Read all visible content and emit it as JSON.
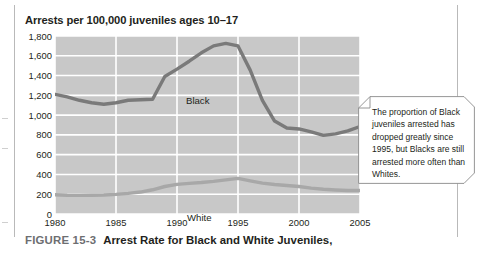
{
  "figure": {
    "chart_title": "Arrests per 100,000 juveniles ages 10–17",
    "caption_number": "FIGURE 15-3",
    "caption_text": "Arrest Rate for Black and White Juveniles,"
  },
  "callout": {
    "text": "The proportion of Black juveniles arrested has dropped greatly since 1995, but Blacks are still arrested more often than Whites."
  },
  "colors": {
    "plot_background": "#c8c8c8",
    "gridline": "#ffffff",
    "series_black": "#7a7a7a",
    "series_white": "#a8a8a8",
    "text": "#231f20",
    "caption_number": "#6d6e71",
    "page_border": "#b9b9b9"
  },
  "chart_data": {
    "type": "line",
    "title": "Arrests per 100,000 juveniles ages 10–17",
    "xlabel": "",
    "ylabel": "Arrests per 100,000 juveniles ages 10–17",
    "xlim": [
      1980,
      2005
    ],
    "ylim": [
      0,
      1800
    ],
    "grid": true,
    "legend": "inline-labels",
    "xticks": [
      1980,
      1985,
      1990,
      1995,
      2000,
      2005
    ],
    "xtick_labels": [
      "1980",
      "1985",
      "1990",
      "1995",
      "2000",
      "2005"
    ],
    "yticks": [
      0,
      200,
      400,
      600,
      800,
      1000,
      1200,
      1400,
      1600,
      1800
    ],
    "ytick_labels": [
      "0",
      "200",
      "400",
      "600",
      "800",
      "1,000",
      "1,200",
      "1,400",
      "1,600",
      "1,800"
    ],
    "x": [
      1980,
      1981,
      1982,
      1983,
      1984,
      1985,
      1986,
      1987,
      1988,
      1989,
      1990,
      1991,
      1992,
      1993,
      1994,
      1995,
      1996,
      1997,
      1998,
      1999,
      2000,
      2001,
      2002,
      2003,
      2004,
      2005
    ],
    "series": [
      {
        "name": "Black",
        "label": "Black",
        "color": "#7a7a7a",
        "values": [
          1210,
          1185,
          1150,
          1125,
          1110,
          1125,
          1150,
          1155,
          1160,
          1390,
          1465,
          1545,
          1630,
          1700,
          1725,
          1700,
          1455,
          1150,
          940,
          870,
          860,
          830,
          795,
          810,
          840,
          885
        ]
      },
      {
        "name": "White",
        "label": "White",
        "color": "#a8a8a8",
        "values": [
          195,
          190,
          188,
          190,
          192,
          198,
          208,
          222,
          245,
          278,
          300,
          310,
          318,
          330,
          345,
          360,
          335,
          312,
          298,
          288,
          278,
          262,
          250,
          243,
          238,
          238
        ]
      }
    ],
    "annotations": [
      {
        "name": "callout",
        "text": "The proportion of Black juveniles arrested has dropped greatly since 1995, but Blacks are still arrested more often than Whites."
      }
    ]
  }
}
